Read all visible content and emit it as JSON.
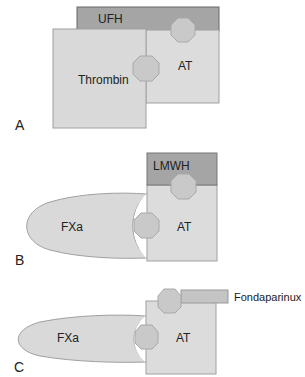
{
  "colors": {
    "protein_fill": "#d9d9d9",
    "protein_stroke": "#9a9a9a",
    "heparin_fill": "#a5a5a5",
    "heparin_stroke": "#666666",
    "octagon_fill": "#c9c9c9",
    "octagon_stroke": "#a8a8a8",
    "fonda_fill": "#c4c4c4"
  },
  "panels": [
    {
      "id": "A",
      "label": "A",
      "heparin": "UFH",
      "protease": "Thrombin",
      "inhibitor": "AT"
    },
    {
      "id": "B",
      "label": "B",
      "heparin": "LMWH",
      "protease": "FXa",
      "inhibitor": "AT"
    },
    {
      "id": "C",
      "label": "C",
      "heparin": "Fondaparinux",
      "protease": "FXa",
      "inhibitor": "AT"
    }
  ]
}
